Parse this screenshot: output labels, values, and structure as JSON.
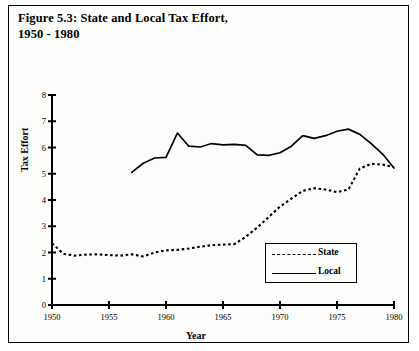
{
  "figure": {
    "title_line1": "Figure 5.3: State and Local Tax Effort,",
    "title_line2": "1950 - 1980",
    "title_full": "Figure 5.3: State and Local Tax Effort, 1950 - 1980"
  },
  "legend": {
    "entries": [
      {
        "label": "State",
        "style": "dotted"
      },
      {
        "label": "Local",
        "style": "solid"
      }
    ]
  },
  "axes": {
    "ylabel": "Tax Effort",
    "xlabel": "Year",
    "yticks": [
      "0",
      "1",
      "2",
      "3",
      "4",
      "5",
      "6",
      "7",
      "8"
    ],
    "xticks": [
      "1950",
      "1955",
      "1960",
      "1965",
      "1970",
      "1975",
      "1980"
    ]
  },
  "colors": {
    "line": "#000000",
    "frame": "#000000",
    "background": "#fdfdfb"
  },
  "chart_data": {
    "type": "line",
    "title": "Figure 5.3: State and Local Tax Effort, 1950 - 1980",
    "xlabel": "Year",
    "ylabel": "Tax Effort",
    "xlim": [
      1950,
      1980
    ],
    "ylim": [
      0,
      8
    ],
    "ytick_step": 1,
    "xtick_step": 5,
    "grid": false,
    "legend_position": "inside-lower-right",
    "x": [
      1950,
      1951,
      1952,
      1953,
      1954,
      1955,
      1956,
      1957,
      1958,
      1959,
      1960,
      1961,
      1962,
      1963,
      1964,
      1965,
      1966,
      1967,
      1968,
      1969,
      1970,
      1971,
      1972,
      1973,
      1974,
      1975,
      1976,
      1977,
      1978,
      1979,
      1980
    ],
    "series": [
      {
        "name": "State",
        "style": "dotted",
        "values": [
          2.35,
          1.95,
          1.88,
          1.92,
          1.93,
          1.9,
          1.88,
          1.93,
          1.85,
          2.0,
          2.08,
          2.1,
          2.15,
          2.22,
          2.28,
          2.3,
          2.32,
          2.6,
          2.95,
          3.35,
          3.75,
          4.05,
          4.35,
          4.45,
          4.4,
          4.3,
          4.4,
          5.2,
          5.38,
          5.35,
          5.25
        ]
      },
      {
        "name": "Local",
        "style": "solid",
        "values": [
          null,
          null,
          null,
          null,
          null,
          null,
          null,
          5.05,
          5.4,
          5.6,
          5.62,
          6.55,
          6.05,
          6.02,
          6.15,
          6.1,
          6.12,
          6.08,
          5.72,
          5.7,
          5.8,
          6.05,
          6.45,
          6.35,
          6.45,
          6.62,
          6.7,
          6.5,
          6.15,
          5.75,
          5.22
        ]
      }
    ]
  }
}
